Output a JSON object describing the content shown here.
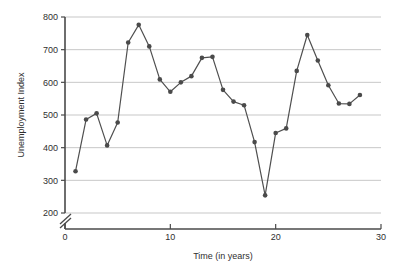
{
  "chart_data": {
    "type": "line",
    "title": "",
    "xlabel": "Time (in years)",
    "ylabel": "Unemployment Index",
    "xlim": [
      0,
      30
    ],
    "ylim": [
      200,
      800
    ],
    "y_axis_break": true,
    "grid": true,
    "legend": "none",
    "marker": "filled-circle",
    "line_color": "#4f4f4f",
    "marker_color": "#4a4a4a",
    "grid_color": "#b9b9b9",
    "x_ticks": [
      0,
      10,
      20,
      30
    ],
    "x_tick_labels": [
      "0",
      "10",
      "20",
      "30"
    ],
    "y_ticks": [
      200,
      300,
      400,
      500,
      600,
      700,
      800
    ],
    "y_tick_labels": [
      "200",
      "300",
      "400",
      "500",
      "600",
      "700",
      "800"
    ],
    "x": [
      1,
      2,
      3,
      4,
      5,
      6,
      7,
      8,
      9,
      10,
      11,
      12,
      13,
      14,
      15,
      16,
      17,
      18,
      19,
      20,
      21,
      22,
      23,
      24,
      25,
      26,
      27,
      28
    ],
    "values": [
      328,
      486,
      505,
      407,
      477,
      722,
      776,
      710,
      609,
      571,
      600,
      619,
      675,
      678,
      577,
      541,
      530,
      417,
      254,
      445,
      459,
      635,
      745,
      667,
      591,
      535,
      534,
      561
    ]
  }
}
